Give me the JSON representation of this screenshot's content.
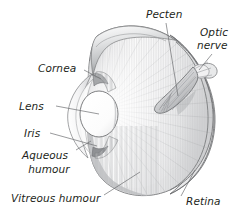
{
  "figure": {
    "background_color": "#ffffff",
    "width": 241,
    "height": 216
  },
  "labels": {
    "pecten": "Pecten",
    "optic_nerve_line1": "Optic",
    "optic_nerve_line2": "nerve",
    "cornea": "Cornea",
    "lens": "Lens",
    "iris": "Iris",
    "aqueous_line1": "Aqueous",
    "aqueous_line2": "humour",
    "vitreous": "Vitreous humour",
    "retina": "Retina"
  },
  "colors": {
    "label_text": "#231f20",
    "leader_line": "#6d6e71",
    "sclera_outline": "#58595b",
    "eyeball_light": "#f2f2f2",
    "eyeball_mid": "#d6d6d6",
    "eyeball_shadow": "#a7a9ac",
    "lens_fill": "#ffffff",
    "pecten_fill": "#cfd0d2",
    "background": "#ffffff"
  },
  "structures": [
    {
      "name": "sclera",
      "description": "Outer eyeball wall, large ovoid dome"
    },
    {
      "name": "retina",
      "description": "Inner lining at back of eyeball"
    },
    {
      "name": "cornea",
      "description": "Transparent anterior bulge at left"
    },
    {
      "name": "lens",
      "description": "White ellipse behind the cornea"
    },
    {
      "name": "iris",
      "description": "Ring surrounding the lens"
    },
    {
      "name": "aqueous-humour",
      "description": "Chamber between cornea and lens"
    },
    {
      "name": "vitreous-humour",
      "description": "Large chamber filling the eyeball"
    },
    {
      "name": "pecten",
      "description": "Pleated fan structure projecting from optic nerve head"
    },
    {
      "name": "optic-nerve",
      "description": "Nerve exiting at the back right of the eye"
    }
  ]
}
